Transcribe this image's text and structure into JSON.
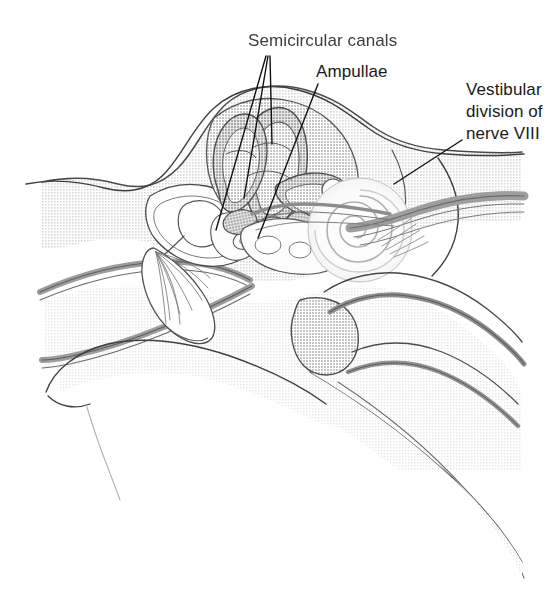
{
  "figure": {
    "type": "anatomical-illustration",
    "width": 558,
    "height": 607,
    "background_color": "#ffffff"
  },
  "labels": [
    {
      "id": "semicircular-canals",
      "text": "Semicircular canals",
      "x": 248,
      "y": 46,
      "blurred": true,
      "leader_lines": 3
    },
    {
      "id": "ampullae",
      "text": "Ampullae",
      "x": 316,
      "y": 77,
      "blurred": false,
      "leader_lines": 1
    },
    {
      "id": "vestibular-nerve",
      "text_line_1": "Vestibular",
      "text_line_2": "division of",
      "text_line_3": "nerve VIII",
      "x": 466,
      "y": 95,
      "blurred": false,
      "leader_lines": 1
    }
  ],
  "colors": {
    "outline": "#3a3a3a",
    "outline_soft": "#6e6e6e",
    "tissue_light": "#e3e3e3",
    "tissue_mid": "#cfcfcf",
    "tissue_dark": "#b4b4b4",
    "canal_fill": "#b9b9b9",
    "bone_white": "#fdfdfd",
    "cochlea_white": "#fbfbfb",
    "nerve_gray": "#9a9a9a",
    "text": "#1a1a1a",
    "background": "#ffffff"
  },
  "structures": [
    {
      "id": "skull-temporal-bone",
      "name": "Temporal bone / skull tissue"
    },
    {
      "id": "semicircular-canals",
      "name": "Semicircular canals"
    },
    {
      "id": "ampullae",
      "name": "Ampullae"
    },
    {
      "id": "vestibule",
      "name": "Vestibule"
    },
    {
      "id": "cochlea",
      "name": "Cochlea (spiral)"
    },
    {
      "id": "vestibulocochlear-nerve",
      "name": "Vestibulocochlear nerve (VIII)"
    },
    {
      "id": "ossicles",
      "name": "Auditory ossicles"
    },
    {
      "id": "tympanic-membrane",
      "name": "Tympanic membrane (eardrum)"
    },
    {
      "id": "external-auditory-canal",
      "name": "External auditory canal"
    },
    {
      "id": "eustachian-tube",
      "name": "Eustachian tube"
    },
    {
      "id": "mandible-condyle",
      "name": "Mandibular condyle"
    }
  ]
}
